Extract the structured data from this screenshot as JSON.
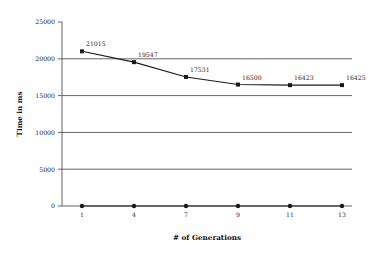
{
  "chart_data": {
    "type": "line",
    "title": "",
    "xlabel": "# of Generations",
    "ylabel": "Time in ms",
    "categories": [
      "1",
      "4",
      "7",
      "9",
      "11",
      "13"
    ],
    "x": [
      1,
      4,
      7,
      9,
      11,
      13
    ],
    "series": [
      {
        "name": "Time",
        "values": [
          21015,
          19547,
          17531,
          16500,
          16423,
          16425
        ],
        "point_labels": [
          "21015",
          "19547",
          "17531",
          "16500",
          "16423",
          "16425"
        ],
        "marker": "square",
        "color": "#1a1a1a"
      },
      {
        "name": "Baseline",
        "values": [
          0,
          0,
          0,
          0,
          0,
          0
        ],
        "point_labels": [
          "",
          "",
          "",
          "",
          "",
          ""
        ],
        "marker": "circle",
        "color": "#1a1a1a"
      }
    ],
    "ylim": [
      0,
      25000
    ],
    "yticks": [
      0,
      5000,
      10000,
      15000,
      20000,
      25000
    ],
    "ytick_labels": [
      "0",
      "5000",
      "10000",
      "15000",
      "20000",
      "25000"
    ],
    "gridline_values": [
      0,
      5000,
      10000,
      15000,
      20000
    ],
    "grid": true,
    "legend": "none",
    "axis_color": "#555555",
    "grid_color": "#555555",
    "line_color": "#1a1a1a",
    "background": "#ffffff"
  }
}
